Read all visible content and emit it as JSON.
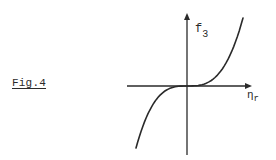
{
  "figure": {
    "label": "Fig.4"
  },
  "colors": {
    "ink": "#2a2a2a",
    "background": "#ffffff"
  },
  "chart_data": {
    "type": "line",
    "title": "",
    "xlabel": "ηr",
    "ylabel": "f3",
    "xlabel_main": "η",
    "xlabel_sub": "r",
    "ylabel_main": "f",
    "ylabel_sub": "3",
    "grid": false,
    "legend": null,
    "ticks": "none",
    "series": [
      {
        "name": "f3(ηr)",
        "x": [
          -1.0,
          -0.75,
          -0.5,
          -0.25,
          0.0,
          0.25,
          0.5,
          0.75,
          1.0
        ],
        "values": [
          -1.0,
          -0.42,
          -0.125,
          -0.016,
          0.0,
          0.016,
          0.125,
          0.42,
          1.0
        ]
      }
    ],
    "xlim": [
      -1.0,
      1.2
    ],
    "ylim": [
      -1.2,
      1.2
    ]
  }
}
